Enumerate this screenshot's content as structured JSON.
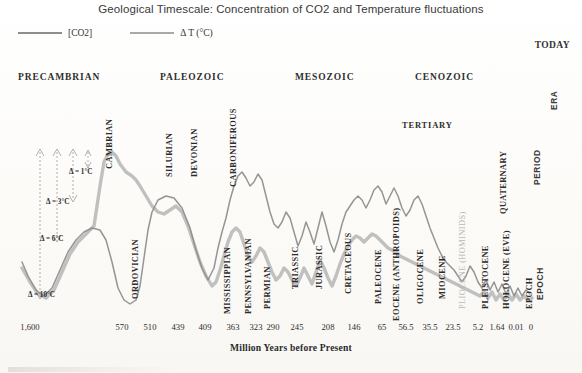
{
  "title": "Geological Timescale: Concentration of CO2 and Temperature fluctuations",
  "legend": {
    "co2": {
      "label": "[CO2]",
      "color": "#8f8f8f",
      "icon": "line-swatch"
    },
    "temp": {
      "label": "Δ T (°C)",
      "color": "#a9a9a9",
      "icon": "line-swatch"
    }
  },
  "today_label": "TODAY",
  "right_column": [
    {
      "label": "ERA"
    },
    {
      "label": "PERIOD"
    },
    {
      "label": "EPOCH"
    }
  ],
  "eras": [
    {
      "label": "PRECAMBRIAN",
      "x": 18
    },
    {
      "label": "PALEOZOIC",
      "x": 160
    },
    {
      "label": "MESOZOIC",
      "x": 295
    },
    {
      "label": "CENOZOIC",
      "x": 415
    }
  ],
  "supergroup": {
    "label": "TERTIARY"
  },
  "periods": [
    {
      "label": "CAMBRIAN",
      "x": 114,
      "y": 160,
      "faint": false
    },
    {
      "label": "ORDOVICIAN",
      "x": 140,
      "y": 290,
      "faint": false
    },
    {
      "label": "SILURIAN",
      "x": 174,
      "y": 168,
      "faint": false
    },
    {
      "label": "DEVONIAN",
      "x": 199,
      "y": 168,
      "faint": false
    },
    {
      "label": "CARBONIFEROUS",
      "x": 238,
      "y": 178,
      "faint": false
    },
    {
      "label": "MISSISSIPPIAN",
      "x": 232,
      "y": 305,
      "faint": false
    },
    {
      "label": "PENNSYLVANIAN",
      "x": 253,
      "y": 305,
      "faint": false
    },
    {
      "label": "PERMIAN",
      "x": 272,
      "y": 300,
      "faint": false
    },
    {
      "label": "TRIASSIC",
      "x": 300,
      "y": 280,
      "faint": false
    },
    {
      "label": "JURASSIC",
      "x": 324,
      "y": 280,
      "faint": false
    },
    {
      "label": "CRETACEOUS",
      "x": 353,
      "y": 285,
      "faint": false
    },
    {
      "label": "PALEOCENE",
      "x": 383,
      "y": 295,
      "faint": false
    },
    {
      "label": "EOCENE (ANTHROPOIDS)",
      "x": 401,
      "y": 312,
      "faint": false
    },
    {
      "label": "OLIGOCENE",
      "x": 425,
      "y": 295,
      "faint": false
    },
    {
      "label": "MIOCENE",
      "x": 447,
      "y": 290,
      "faint": false
    },
    {
      "label": "PLIOCENE (HOMINIDS)",
      "x": 467,
      "y": 300,
      "faint": true
    },
    {
      "label": "PLEISTOCENE",
      "x": 490,
      "y": 300,
      "faint": false
    },
    {
      "label": "QUATERNARY",
      "x": 508,
      "y": 205,
      "faint": false
    },
    {
      "label": "HOLOCENE (EVE)",
      "x": 511,
      "y": 300,
      "faint": false
    },
    {
      "label": "EPOCH",
      "x": 534,
      "y": 300,
      "faint": false
    }
  ],
  "delta_annotations": [
    {
      "label": "Δ = 1°C",
      "x": 69,
      "y": 168
    },
    {
      "label": "Δ = 3°C",
      "x": 46,
      "y": 198
    },
    {
      "label": "Δ = 6°C",
      "x": 40,
      "y": 235
    },
    {
      "label": "Δ = 10°C",
      "x": 28,
      "y": 291
    }
  ],
  "xaxis": {
    "title": "Million Years before Present",
    "ticks": [
      {
        "label": "1,600",
        "x": 30
      },
      {
        "label": "570",
        "x": 122
      },
      {
        "label": "510",
        "x": 150
      },
      {
        "label": "439",
        "x": 178
      },
      {
        "label": "409",
        "x": 205
      },
      {
        "label": "363",
        "x": 233
      },
      {
        "label": "323",
        "x": 256
      },
      {
        "label": "290",
        "x": 273
      },
      {
        "label": "245",
        "x": 297
      },
      {
        "label": "208",
        "x": 328
      },
      {
        "label": "146",
        "x": 354
      },
      {
        "label": "65",
        "x": 382
      },
      {
        "label": "56.5",
        "x": 406
      },
      {
        "label": "35.5",
        "x": 430
      },
      {
        "label": "23.5",
        "x": 453
      },
      {
        "label": "5.2",
        "x": 478
      },
      {
        "label": "1.64",
        "x": 497
      },
      {
        "label": "0.01",
        "x": 516
      },
      {
        "label": "0",
        "x": 531
      }
    ]
  },
  "chart_data": {
    "type": "line",
    "title": "Geological Timescale: Concentration of CO2 and Temperature fluctuations",
    "xlabel": "Million Years before Present",
    "ylabel": "",
    "grid": false,
    "legend_position": "top-left",
    "x_tick_labels": [
      "1,600",
      "570",
      "510",
      "439",
      "409",
      "363",
      "323",
      "290",
      "245",
      "208",
      "146",
      "65",
      "56.5",
      "35.5",
      "23.5",
      "5.2",
      "1.64",
      "0.01",
      "0"
    ],
    "x_tick_values": [
      1600,
      570,
      510,
      439,
      409,
      363,
      323,
      290,
      245,
      208,
      146,
      65,
      56.5,
      35.5,
      23.5,
      5.2,
      1.64,
      0.01,
      0
    ],
    "xlim": [
      1600,
      0
    ],
    "x_scale": "non-linear geological",
    "series": [
      {
        "name": "[CO2]",
        "color": "#8f8f8f",
        "points_px": [
          [
            22,
            262
          ],
          [
            28,
            276
          ],
          [
            36,
            290
          ],
          [
            44,
            296
          ],
          [
            52,
            288
          ],
          [
            60,
            270
          ],
          [
            68,
            252
          ],
          [
            76,
            240
          ],
          [
            84,
            232
          ],
          [
            92,
            228
          ],
          [
            100,
            230
          ],
          [
            106,
            240
          ],
          [
            112,
            262
          ],
          [
            118,
            288
          ],
          [
            124,
            300
          ],
          [
            130,
            304
          ],
          [
            136,
            300
          ],
          [
            140,
            286
          ],
          [
            144,
            258
          ],
          [
            148,
            230
          ],
          [
            152,
            212
          ],
          [
            158,
            200
          ],
          [
            166,
            196
          ],
          [
            174,
            198
          ],
          [
            182,
            208
          ],
          [
            190,
            228
          ],
          [
            196,
            250
          ],
          [
            202,
            268
          ],
          [
            208,
            280
          ],
          [
            214,
            268
          ],
          [
            218,
            248
          ],
          [
            222,
            232
          ],
          [
            226,
            218
          ],
          [
            230,
            200
          ],
          [
            234,
            186
          ],
          [
            238,
            176
          ],
          [
            242,
            172
          ],
          [
            246,
            178
          ],
          [
            250,
            186
          ],
          [
            254,
            182
          ],
          [
            258,
            174
          ],
          [
            262,
            180
          ],
          [
            266,
            196
          ],
          [
            270,
            212
          ],
          [
            274,
            224
          ],
          [
            278,
            228
          ],
          [
            282,
            222
          ],
          [
            286,
            212
          ],
          [
            290,
            218
          ],
          [
            294,
            232
          ],
          [
            298,
            246
          ],
          [
            302,
            236
          ],
          [
            306,
            222
          ],
          [
            310,
            232
          ],
          [
            314,
            244
          ],
          [
            318,
            228
          ],
          [
            322,
            212
          ],
          [
            326,
            226
          ],
          [
            330,
            242
          ],
          [
            334,
            252
          ],
          [
            338,
            240
          ],
          [
            342,
            224
          ],
          [
            346,
            212
          ],
          [
            350,
            206
          ],
          [
            354,
            200
          ],
          [
            358,
            196
          ],
          [
            362,
            200
          ],
          [
            366,
            208
          ],
          [
            370,
            200
          ],
          [
            374,
            190
          ],
          [
            378,
            186
          ],
          [
            382,
            192
          ],
          [
            386,
            204
          ],
          [
            390,
            196
          ],
          [
            394,
            188
          ],
          [
            398,
            196
          ],
          [
            402,
            208
          ],
          [
            406,
            216
          ],
          [
            410,
            210
          ],
          [
            414,
            200
          ],
          [
            418,
            196
          ],
          [
            422,
            204
          ],
          [
            426,
            216
          ],
          [
            430,
            228
          ],
          [
            434,
            238
          ],
          [
            438,
            248
          ],
          [
            442,
            256
          ],
          [
            446,
            262
          ],
          [
            450,
            266
          ],
          [
            454,
            270
          ],
          [
            458,
            276
          ],
          [
            462,
            282
          ],
          [
            466,
            276
          ],
          [
            470,
            266
          ],
          [
            474,
            272
          ],
          [
            478,
            282
          ],
          [
            482,
            288
          ],
          [
            486,
            280
          ],
          [
            490,
            290
          ],
          [
            494,
            282
          ],
          [
            498,
            292
          ],
          [
            502,
            284
          ],
          [
            506,
            294
          ],
          [
            510,
            286
          ],
          [
            514,
            296
          ],
          [
            518,
            288
          ],
          [
            522,
            296
          ],
          [
            526,
            290
          ],
          [
            530,
            294
          ]
        ]
      },
      {
        "name": "Δ T (°C)",
        "color": "#bdbdbd",
        "points_px": [
          [
            22,
            268
          ],
          [
            30,
            282
          ],
          [
            38,
            294
          ],
          [
            46,
            298
          ],
          [
            54,
            290
          ],
          [
            62,
            272
          ],
          [
            70,
            254
          ],
          [
            78,
            242
          ],
          [
            86,
            234
          ],
          [
            94,
            226
          ],
          [
            100,
            186
          ],
          [
            104,
            162
          ],
          [
            108,
            154
          ],
          [
            112,
            152
          ],
          [
            116,
            156
          ],
          [
            120,
            164
          ],
          [
            126,
            172
          ],
          [
            132,
            176
          ],
          [
            136,
            180
          ],
          [
            140,
            186
          ],
          [
            146,
            196
          ],
          [
            152,
            206
          ],
          [
            158,
            212
          ],
          [
            164,
            214
          ],
          [
            170,
            210
          ],
          [
            176,
            206
          ],
          [
            182,
            212
          ],
          [
            188,
            226
          ],
          [
            194,
            244
          ],
          [
            200,
            262
          ],
          [
            206,
            276
          ],
          [
            212,
            286
          ],
          [
            216,
            282
          ],
          [
            220,
            270
          ],
          [
            224,
            256
          ],
          [
            228,
            242
          ],
          [
            232,
            232
          ],
          [
            236,
            228
          ],
          [
            240,
            232
          ],
          [
            244,
            244
          ],
          [
            248,
            256
          ],
          [
            252,
            262
          ],
          [
            256,
            256
          ],
          [
            260,
            248
          ],
          [
            264,
            252
          ],
          [
            268,
            262
          ],
          [
            272,
            272
          ],
          [
            276,
            280
          ],
          [
            280,
            276
          ],
          [
            284,
            268
          ],
          [
            288,
            272
          ],
          [
            292,
            280
          ],
          [
            296,
            286
          ],
          [
            300,
            278
          ],
          [
            304,
            268
          ],
          [
            308,
            276
          ],
          [
            312,
            284
          ],
          [
            316,
            272
          ],
          [
            320,
            260
          ],
          [
            324,
            268
          ],
          [
            328,
            278
          ],
          [
            332,
            286
          ],
          [
            336,
            276
          ],
          [
            340,
            264
          ],
          [
            344,
            254
          ],
          [
            348,
            246
          ],
          [
            352,
            240
          ],
          [
            356,
            236
          ],
          [
            360,
            238
          ],
          [
            364,
            242
          ],
          [
            368,
            238
          ],
          [
            372,
            234
          ],
          [
            376,
            236
          ],
          [
            380,
            240
          ],
          [
            384,
            244
          ],
          [
            388,
            248
          ],
          [
            392,
            250
          ],
          [
            396,
            252
          ],
          [
            400,
            256
          ],
          [
            404,
            258
          ],
          [
            408,
            260
          ],
          [
            412,
            262
          ],
          [
            416,
            264
          ],
          [
            420,
            266
          ],
          [
            424,
            268
          ],
          [
            428,
            270
          ],
          [
            432,
            272
          ],
          [
            436,
            274
          ],
          [
            440,
            276
          ],
          [
            444,
            278
          ],
          [
            448,
            280
          ],
          [
            452,
            282
          ],
          [
            456,
            284
          ],
          [
            460,
            286
          ],
          [
            464,
            288
          ],
          [
            468,
            290
          ],
          [
            472,
            292
          ],
          [
            476,
            294
          ],
          [
            480,
            296
          ],
          [
            484,
            292
          ],
          [
            488,
            298
          ],
          [
            492,
            292
          ],
          [
            496,
            300
          ],
          [
            500,
            294
          ],
          [
            504,
            300
          ],
          [
            508,
            294
          ],
          [
            512,
            300
          ],
          [
            516,
            294
          ],
          [
            520,
            300
          ],
          [
            524,
            296
          ],
          [
            528,
            300
          ],
          [
            532,
            298
          ]
        ]
      }
    ]
  }
}
